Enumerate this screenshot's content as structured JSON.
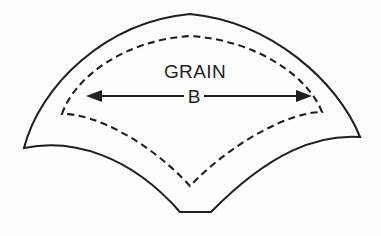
{
  "diagram": {
    "title_label": "GRAIN",
    "dimension_label": "B",
    "type": "annular-sector-gore-pattern",
    "colors": {
      "line": "#1f1f1f",
      "background": "#fefefe",
      "fill": "none"
    },
    "shapes": {
      "outer_outline": {
        "name": "solid-cut-outline",
        "style": "solid",
        "left_tip": [
          24,
          148
        ],
        "top_apex": [
          190,
          14
        ],
        "right_tip": [
          360,
          137
        ],
        "bottom_flat_left": [
          180,
          212
        ],
        "bottom_flat_right": [
          211,
          212
        ]
      },
      "inner_outline": {
        "name": "dashed-stitch-line",
        "style": "dashed",
        "dash_length": 7,
        "gap_length": 4.5,
        "left_corner": [
          62,
          114
        ],
        "top_apex": [
          190,
          36
        ],
        "right_corner": [
          322,
          112
        ],
        "bottom_vertex": [
          190,
          186
        ]
      }
    },
    "dimension": {
      "name": "grain-direction-arrow",
      "y": 96,
      "left_tip_x": 86,
      "right_tip_x": 312,
      "double_headed": true,
      "gap_for_label": [
        184,
        204
      ]
    },
    "labels": {
      "grain": {
        "text": "GRAIN",
        "x": 195,
        "y": 78
      },
      "b": {
        "text": "B",
        "x": 194,
        "y": 102
      }
    }
  }
}
